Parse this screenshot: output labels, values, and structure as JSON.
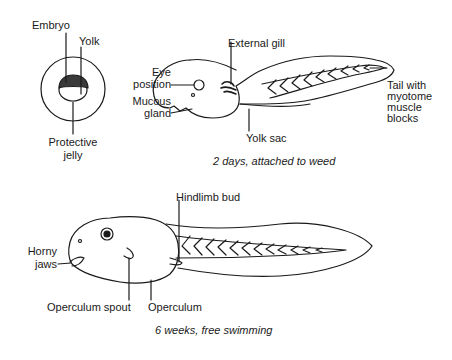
{
  "figure": {
    "egg": {
      "labels": {
        "embryo": "Embryo",
        "yolk": "Yolk",
        "protective_jelly_1": "Protective",
        "protective_jelly_2": "jelly"
      }
    },
    "hatchling": {
      "labels": {
        "external_gill": "External gill",
        "eye_position_1": "Eye",
        "eye_position_2": "position",
        "mucous_gland_1": "Mucous",
        "mucous_gland_2": "gland",
        "yolk_sac": "Yolk sac",
        "tail_1": "Tail with",
        "tail_2": "myotome",
        "tail_3": "muscle",
        "tail_4": "blocks"
      },
      "caption": "2 days, attached to weed"
    },
    "tadpole": {
      "labels": {
        "hindlimb_bud": "Hindlimb bud",
        "horny_jaws_1": "Horny",
        "horny_jaws_2": "jaws",
        "operculum_spout": "Operculum spout",
        "operculum": "Operculum"
      },
      "caption": "6 weeks, free swimming"
    }
  },
  "colors": {
    "ink": "#1a1a1a",
    "embryo_fill": "#3a3a3a",
    "background": "#ffffff"
  }
}
